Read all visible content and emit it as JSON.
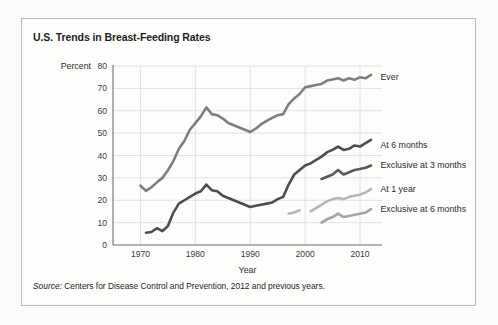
{
  "figure": {
    "title": "U.S. Trends in Breast-Feeding Rates",
    "source_prefix": "Source:",
    "source_text": " Centers for Disease Control and Prevention, 2012 and previous years.",
    "border_color": "#b9bcbe",
    "background_color": "#fdfdfc"
  },
  "chart_data": {
    "type": "line",
    "title": "U.S. Trends in Breast-Feeding Rates",
    "xlabel": "Year",
    "ylabel": "Percent",
    "xlim": [
      1965,
      2014
    ],
    "ylim": [
      0,
      80
    ],
    "xticks": [
      1970,
      1980,
      1990,
      2000,
      2010
    ],
    "xticklabels": [
      "1970",
      "1980",
      "1990",
      "2000",
      "2010"
    ],
    "yticks": [
      0,
      10,
      20,
      30,
      40,
      50,
      60,
      70,
      80
    ],
    "yticklabels": [
      "0",
      "10",
      "20",
      "30",
      "40",
      "50",
      "60",
      "70",
      "80"
    ],
    "grid": "both",
    "legend_position": "right-of-line-ends",
    "series": [
      {
        "name": "Ever",
        "label": "Ever",
        "color": "#7c7f81",
        "label_x": 2013,
        "label_y": 75,
        "x": [
          1970,
          1971,
          1972,
          1973,
          1974,
          1975,
          1976,
          1977,
          1978,
          1979,
          1980,
          1981,
          1982,
          1983,
          1984,
          1985,
          1986,
          1987,
          1988,
          1989,
          1990,
          1991,
          1992,
          1993,
          1994,
          1995,
          1996,
          1997,
          1998,
          1999,
          2000,
          2001,
          2002,
          2003,
          2004,
          2005,
          2006,
          2007,
          2008,
          2009,
          2010,
          2011,
          2012
        ],
        "y": [
          26.5,
          24.2,
          25.8,
          28.0,
          30.0,
          33.4,
          37.5,
          43.0,
          46.5,
          51.5,
          54.5,
          57.5,
          61.5,
          58.5,
          58.0,
          56.5,
          54.5,
          53.5,
          52.5,
          51.5,
          50.5,
          52.0,
          54.0,
          55.5,
          56.8,
          58.0,
          58.5,
          63.0,
          65.5,
          67.5,
          70.5,
          71.0,
          71.5,
          72.0,
          73.5,
          74.0,
          74.5,
          73.5,
          74.5,
          73.8,
          75.0,
          74.5,
          76.0
        ]
      },
      {
        "name": "At 6 months",
        "label": "At 6 months",
        "color": "#4b4d4f",
        "label_x": 2013,
        "label_y": 45,
        "x": [
          1971,
          1972,
          1973,
          1974,
          1975,
          1976,
          1977,
          1978,
          1979,
          1980,
          1981,
          1982,
          1983,
          1984,
          1985,
          1986,
          1987,
          1988,
          1989,
          1990,
          1991,
          1992,
          1993,
          1994,
          1995,
          1996,
          1997,
          1998,
          1999,
          2000,
          2001,
          2002,
          2003,
          2004,
          2005,
          2006,
          2007,
          2008,
          2009,
          2010,
          2011,
          2012
        ],
        "y": [
          5.5,
          5.8,
          7.5,
          6.2,
          8.5,
          14.5,
          18.5,
          20.0,
          21.5,
          23.0,
          24.0,
          27.0,
          24.5,
          24.0,
          22.0,
          21.0,
          20.0,
          19.0,
          18.0,
          17.0,
          17.5,
          18.0,
          18.5,
          19.0,
          20.5,
          21.5,
          27.0,
          31.5,
          33.5,
          35.5,
          36.5,
          38.0,
          39.5,
          41.5,
          42.5,
          44.0,
          42.5,
          43.0,
          44.5,
          44.0,
          45.5,
          47.0
        ]
      },
      {
        "name": "Exclusive at 3 months",
        "label": "Exclusive at 3 months",
        "color": "#57595b",
        "label_x": 2013,
        "label_y": 36,
        "x": [
          2003,
          2004,
          2005,
          2006,
          2007,
          2008,
          2009,
          2010,
          2011,
          2012
        ],
        "y": [
          29.5,
          30.5,
          31.5,
          33.5,
          31.5,
          32.5,
          33.5,
          34.0,
          34.5,
          35.5
        ]
      },
      {
        "name": "At 1 year",
        "label": "At 1 year",
        "color": "#b3b6b8",
        "label_x": 2013,
        "label_y": 25,
        "segments": [
          {
            "x": [
              1997,
              1998,
              1999
            ],
            "y": [
              14.0,
              14.5,
              15.5
            ]
          },
          {
            "x": [
              2001,
              2002,
              2003,
              2004,
              2005,
              2006,
              2007,
              2008,
              2009,
              2010,
              2011,
              2012
            ],
            "y": [
              15.0,
              16.5,
              18.0,
              19.5,
              20.5,
              21.0,
              20.5,
              21.5,
              22.0,
              22.5,
              23.5,
              25.0
            ]
          }
        ]
      },
      {
        "name": "Exclusive at 6 months",
        "label": "Exclusive at 6 months",
        "color": "#a2a5a7",
        "label_x": 2013,
        "label_y": 16,
        "x": [
          2003,
          2004,
          2005,
          2006,
          2007,
          2008,
          2009,
          2010,
          2011,
          2012
        ],
        "y": [
          10.0,
          11.5,
          12.5,
          14.0,
          12.5,
          13.0,
          13.5,
          14.0,
          14.5,
          16.0
        ]
      }
    ]
  }
}
